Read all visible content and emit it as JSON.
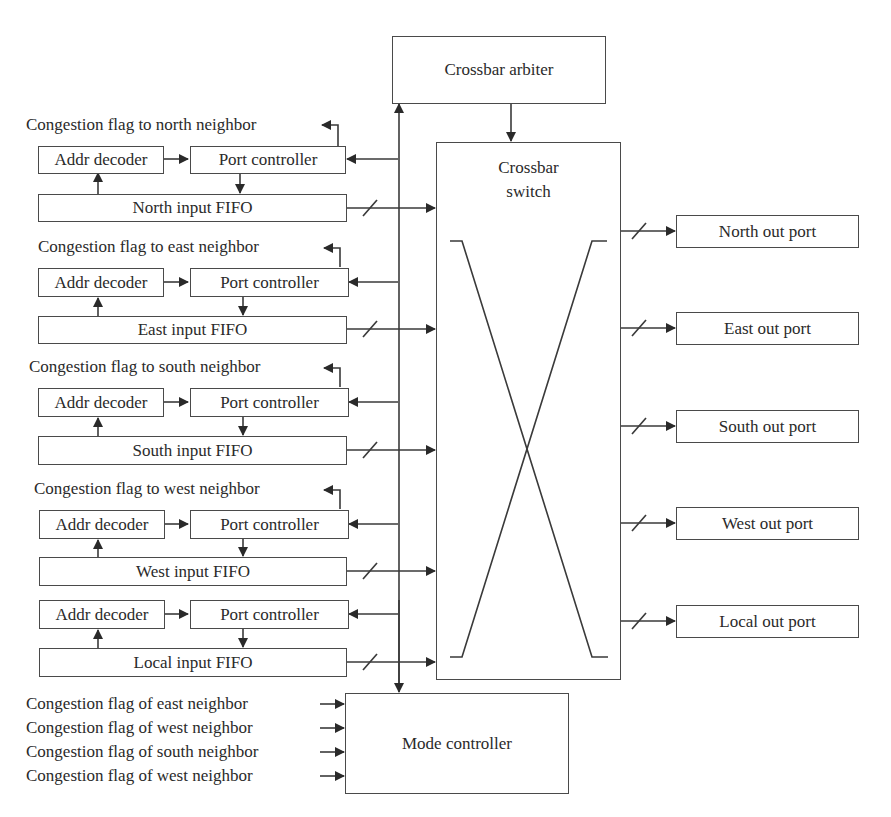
{
  "diagram": {
    "crossbar_arbiter": "Crossbar arbiter",
    "crossbar_switch": {
      "line1": "Crossbar",
      "line2": "switch"
    },
    "mode_controller": "Mode controller",
    "input_ports": [
      {
        "flag_label": "Congestion flag to north neighbor",
        "decoder": "Addr decoder",
        "controller": "Port controller",
        "fifo": "North input FIFO"
      },
      {
        "flag_label": "Congestion flag to east neighbor",
        "decoder": "Addr decoder",
        "controller": "Port controller",
        "fifo": "East input FIFO"
      },
      {
        "flag_label": "Congestion flag to south neighbor",
        "decoder": "Addr decoder",
        "controller": "Port controller",
        "fifo": "South input FIFO"
      },
      {
        "flag_label": "Congestion flag to west neighbor",
        "decoder": "Addr decoder",
        "controller": "Port controller",
        "fifo": "West input FIFO"
      },
      {
        "flag_label": "",
        "decoder": "Addr decoder",
        "controller": "Port controller",
        "fifo": "Local input FIFO"
      }
    ],
    "output_ports": [
      "North out port",
      "East out port",
      "South out port",
      "West out port",
      "Local out port"
    ],
    "mode_inputs": [
      "Congestion flag of east neighbor",
      "Congestion flag of west neighbor",
      "Congestion flag of south neighbor",
      "Congestion flag of west neighbor"
    ]
  }
}
